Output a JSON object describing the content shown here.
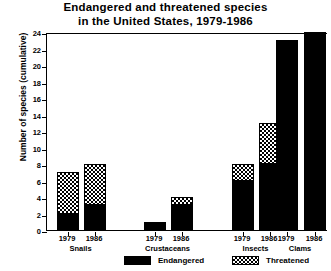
{
  "chart_data": {
    "type": "bar",
    "title": "Endangered and threatened species in the United States, 1979-1986",
    "title_lines": [
      "Endangered and threatened species",
      "in the United States, 1979-1986"
    ],
    "xlabel": "",
    "ylabel": "Number of species (cumulative)",
    "ylim": [
      0,
      24
    ],
    "ytick_values": [
      0,
      2,
      4,
      6,
      8,
      10,
      12,
      14,
      16,
      18,
      20,
      22,
      24
    ],
    "ytick_labels": [
      "0",
      "2",
      "4",
      "6",
      "8",
      "10",
      "12",
      "14",
      "16",
      "18",
      "20",
      "22",
      "24"
    ],
    "grid": false,
    "stacked": true,
    "legend_position": "bottom",
    "groups": [
      "Snails",
      "Crustaceans",
      "Insects",
      "Clams"
    ],
    "categories": [
      "Snails 1979",
      "Snails 1986",
      "Crustaceans 1979",
      "Crustaceans 1986",
      "Insects 1979",
      "Insects 1986",
      "Clams 1979",
      "Clams 1986"
    ],
    "year_labels": [
      "1979",
      "1986",
      "1979",
      "1986",
      "1979",
      "1986",
      "1979",
      "1986"
    ],
    "series": [
      {
        "name": "Endangered",
        "color": "#000000",
        "fill": "solid",
        "values": [
          2,
          3,
          1,
          3,
          6,
          8,
          23,
          24
        ]
      },
      {
        "name": "Threatened",
        "color": "#000000",
        "fill": "checkerboard",
        "values": [
          5,
          5,
          0,
          1,
          2,
          5,
          0,
          0
        ]
      }
    ],
    "totals": [
      7,
      8,
      1,
      4,
      8,
      13,
      23,
      24
    ]
  },
  "legend": {
    "items": [
      {
        "label": "Endangered",
        "swatch": "solid-black-swatch"
      },
      {
        "label": "Threatened",
        "swatch": "checkered-swatch"
      }
    ]
  }
}
